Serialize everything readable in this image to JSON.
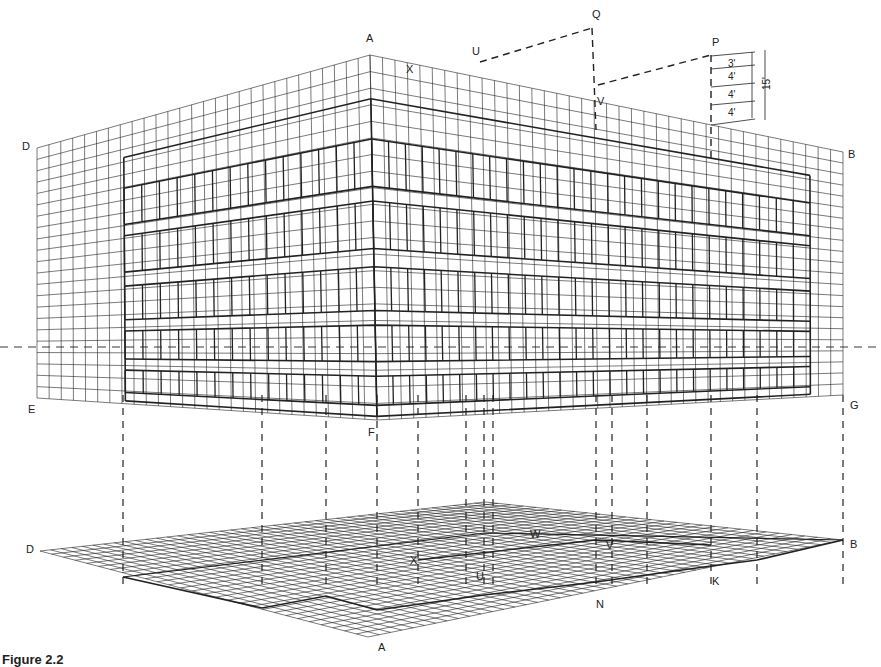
{
  "figure": {
    "caption": "Figure 2.2",
    "ink_color": "#222222",
    "background": "#ffffff"
  },
  "horizon": {
    "y": 347,
    "x_start": 0,
    "x_end": 881
  },
  "elevation": {
    "labels": [
      {
        "text": "A",
        "x": 366,
        "y": 42
      },
      {
        "text": "X",
        "x": 406,
        "y": 73
      },
      {
        "text": "U",
        "x": 472,
        "y": 55
      },
      {
        "text": "Q",
        "x": 592,
        "y": 18
      },
      {
        "text": "V",
        "x": 597,
        "y": 105
      },
      {
        "text": "P",
        "x": 712,
        "y": 46
      },
      {
        "text": "D",
        "x": 22,
        "y": 150
      },
      {
        "text": "B",
        "x": 848,
        "y": 158
      },
      {
        "text": "E",
        "x": 28,
        "y": 413
      },
      {
        "text": "F",
        "x": 368,
        "y": 436
      },
      {
        "text": "G",
        "x": 850,
        "y": 409
      }
    ],
    "corners": {
      "D_top": [
        37,
        148
      ],
      "A_top": [
        370,
        55
      ],
      "B_top": [
        843,
        152
      ],
      "E_bot": [
        37,
        398
      ],
      "F_bot": [
        377,
        420
      ],
      "G_bot": [
        843,
        395
      ]
    },
    "grid": {
      "left_cols": 28,
      "right_cols": 38,
      "rows": 22
    },
    "floors": [
      {
        "top": 0.23,
        "bot": 0.36
      },
      {
        "top": 0.4,
        "bot": 0.53
      },
      {
        "top": 0.58,
        "bot": 0.7
      },
      {
        "top": 0.74,
        "bot": 0.84
      },
      {
        "top": 0.88,
        "bot": 0.96
      }
    ]
  },
  "dimensions": {
    "segments": [
      "3'",
      "4'",
      "4'",
      "4'"
    ],
    "total": "15'"
  },
  "plan": {
    "labels": [
      {
        "text": "D",
        "x": 26,
        "y": 553
      },
      {
        "text": "B",
        "x": 850,
        "y": 548
      },
      {
        "text": "A",
        "x": 378,
        "y": 651
      },
      {
        "text": "W",
        "x": 530,
        "y": 538
      },
      {
        "text": "V",
        "x": 606,
        "y": 549
      },
      {
        "text": "X",
        "x": 410,
        "y": 564
      },
      {
        "text": "U",
        "x": 476,
        "y": 580
      },
      {
        "text": "N",
        "x": 596,
        "y": 608
      },
      {
        "text": "K",
        "x": 712,
        "y": 585
      }
    ],
    "corners": {
      "D": [
        40,
        551
      ],
      "back": [
        485,
        502
      ],
      "B": [
        843,
        540
      ],
      "A": [
        368,
        637
      ]
    },
    "grid": {
      "cols": 42,
      "rows": 28
    }
  },
  "projectors": [
    123,
    262,
    326,
    377,
    418,
    466,
    484,
    493,
    596,
    612,
    647,
    711,
    757,
    843
  ]
}
